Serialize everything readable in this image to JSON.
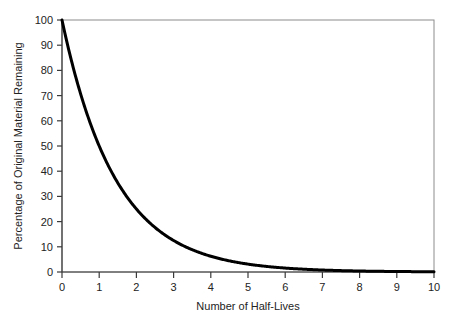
{
  "chart_data": {
    "type": "line",
    "title": "",
    "xlabel": "Number of Half-Lives",
    "ylabel": "Percentage of Original Material Remaining",
    "xlim": [
      0,
      10
    ],
    "ylim": [
      0,
      100
    ],
    "grid": false,
    "legend": null,
    "x_ticks": [
      "0",
      "1",
      "2",
      "3",
      "4",
      "5",
      "6",
      "7",
      "8",
      "9",
      "10"
    ],
    "y_ticks": [
      "0",
      "10",
      "20",
      "30",
      "40",
      "50",
      "60",
      "70",
      "80",
      "90",
      "100"
    ],
    "series": [
      {
        "name": "Percentage of original material remaining",
        "formula": "y = 100 * (0.5)^x",
        "color": "#000000",
        "line_width": 3,
        "x": [
          0,
          0.25,
          0.5,
          0.75,
          1,
          1.25,
          1.5,
          1.75,
          2,
          2.25,
          2.5,
          2.75,
          3,
          3.25,
          3.5,
          3.75,
          4,
          4.25,
          4.5,
          4.75,
          5,
          5.5,
          6,
          6.5,
          7,
          7.5,
          8,
          8.5,
          9,
          9.5,
          10
        ],
        "values": [
          100,
          84.1,
          70.7,
          59.5,
          50,
          42.0,
          35.4,
          29.7,
          25,
          21.0,
          17.7,
          14.9,
          12.5,
          10.5,
          8.8,
          7.4,
          6.25,
          5.3,
          4.4,
          3.7,
          3.125,
          2.21,
          1.5625,
          1.1,
          0.781,
          0.55,
          0.391,
          0.28,
          0.195,
          0.14,
          0.098
        ]
      }
    ],
    "key_points": [
      {
        "x": 0,
        "y": 100
      },
      {
        "x": 1,
        "y": 50
      },
      {
        "x": 2,
        "y": 25
      },
      {
        "x": 3,
        "y": 12.5
      },
      {
        "x": 4,
        "y": 6.25
      },
      {
        "x": 5,
        "y": 3.125
      },
      {
        "x": 6,
        "y": 1.5625
      },
      {
        "x": 7,
        "y": 0.78
      },
      {
        "x": 8,
        "y": 0.39
      },
      {
        "x": 9,
        "y": 0.2
      },
      {
        "x": 10,
        "y": 0.1
      }
    ],
    "colors": {
      "curve": "#000000",
      "frame": "#8c8c8c",
      "tick": "#3a3a3a",
      "text": "#232323",
      "background": "#ffffff"
    }
  }
}
